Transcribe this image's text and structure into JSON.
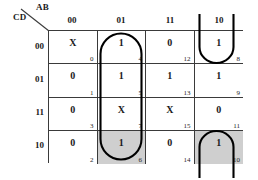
{
  "axes": {
    "row_variable_label": "CD",
    "column_variable_label": "AB",
    "column_headers": [
      "00",
      "01",
      "11",
      "10"
    ],
    "row_headers": [
      "00",
      "01",
      "11",
      "10"
    ]
  },
  "colors": {
    "grid_line": "#3a3a3a",
    "cell_background": "#ffffff",
    "shaded_cell_background": "#cfcfcf",
    "group_outline": "#000000",
    "text": "#1a1a1a"
  },
  "chart_data": {
    "type": "table",
    "xlabel": "AB",
    "ylabel": "CD",
    "categories": [
      "00",
      "01",
      "11",
      "10"
    ],
    "row_categories": [
      "00",
      "01",
      "11",
      "10"
    ],
    "grid_on": true,
    "legend": [],
    "cells": [
      {
        "row": 0,
        "col": 0,
        "value": "X",
        "index": "0",
        "shaded": false
      },
      {
        "row": 0,
        "col": 1,
        "value": "1",
        "index": "4",
        "shaded": false
      },
      {
        "row": 0,
        "col": 2,
        "value": "0",
        "index": "12",
        "shaded": false
      },
      {
        "row": 0,
        "col": 3,
        "value": "1",
        "index": "8",
        "shaded": false
      },
      {
        "row": 1,
        "col": 0,
        "value": "0",
        "index": "1",
        "shaded": false
      },
      {
        "row": 1,
        "col": 1,
        "value": "1",
        "index": "5",
        "shaded": false
      },
      {
        "row": 1,
        "col": 2,
        "value": "1",
        "index": "13",
        "shaded": false
      },
      {
        "row": 1,
        "col": 3,
        "value": "1",
        "index": "9",
        "shaded": false
      },
      {
        "row": 2,
        "col": 0,
        "value": "0",
        "index": "3",
        "shaded": false
      },
      {
        "row": 2,
        "col": 1,
        "value": "X",
        "index": "7",
        "shaded": false
      },
      {
        "row": 2,
        "col": 2,
        "value": "X",
        "index": "15",
        "shaded": false
      },
      {
        "row": 2,
        "col": 3,
        "value": "0",
        "index": "11",
        "shaded": false
      },
      {
        "row": 3,
        "col": 0,
        "value": "0",
        "index": "2",
        "shaded": false
      },
      {
        "row": 3,
        "col": 1,
        "value": "1",
        "index": "6",
        "shaded": true
      },
      {
        "row": 3,
        "col": 2,
        "value": "0",
        "index": "14",
        "shaded": false
      },
      {
        "row": 3,
        "col": 3,
        "value": "1",
        "index": "10",
        "shaded": true
      }
    ],
    "groups": [
      {
        "name": "column-01-group",
        "shape": "vertical-oval",
        "minterms": [
          "4",
          "5",
          "7",
          "6"
        ]
      },
      {
        "name": "wrap-group-top",
        "shape": "open-bottom-wrap",
        "minterms": [
          "8"
        ]
      },
      {
        "name": "wrap-group-bottom",
        "shape": "open-top-wrap",
        "minterms": [
          "10"
        ]
      }
    ]
  }
}
